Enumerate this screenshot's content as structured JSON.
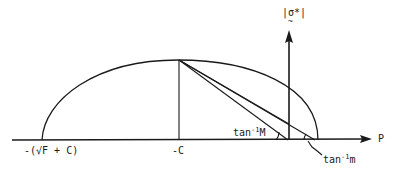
{
  "figure": {
    "type": "yield-surface-diagram",
    "stroke_color": "#1a1a1a",
    "background": "#ffffff"
  },
  "axes": {
    "horizontal": {
      "label": "P"
    },
    "vertical": {
      "label_open": "|",
      "label_symbol": "σ*",
      "label_close": "|",
      "label_tilde": "~"
    }
  },
  "ticks": {
    "left_end": "-(√F + C)",
    "center": "-C"
  },
  "angles": {
    "big_M": {
      "prefix": "tan",
      "exp": "-1",
      "var": "M"
    },
    "small_m": {
      "prefix": "tan",
      "exp": "-1",
      "var": "m"
    }
  }
}
